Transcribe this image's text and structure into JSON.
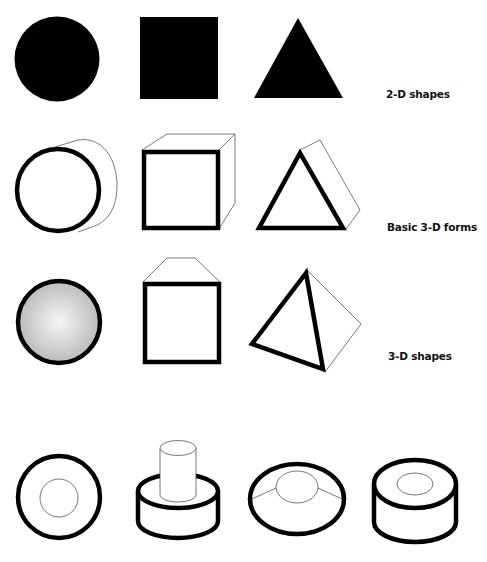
{
  "rows": [
    {
      "label": "2-D shapes",
      "items": [
        "circle",
        "square",
        "triangle"
      ]
    },
    {
      "label": "Basic 3-D forms",
      "items": [
        "cylinder",
        "cube",
        "triangular-prism"
      ]
    },
    {
      "label": "3-D shapes",
      "items": [
        "sphere",
        "box-with-beveled-top",
        "tetrahedron"
      ]
    },
    {
      "label": "",
      "items": [
        "ring-top-view",
        "cylinder-with-peg",
        "dome-with-cap",
        "hollow-cylinder"
      ]
    }
  ],
  "colors": {
    "fill": "#000000",
    "stroke": "#000000",
    "thin_stroke": "#555555",
    "sphere_highlight": "#f4f4f4",
    "sphere_shadow": "#b8b8b8",
    "background": "#ffffff"
  }
}
